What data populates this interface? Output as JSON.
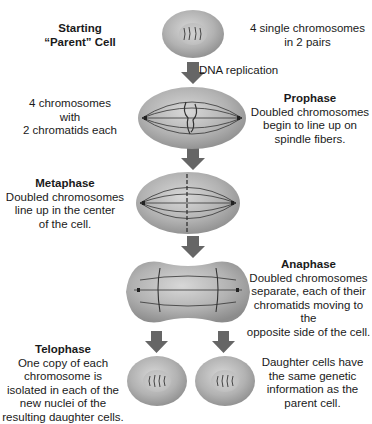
{
  "diagram": {
    "type": "mitosis-stages",
    "colors": {
      "cell_fill": "#b5b5b5",
      "cell_edge": "#8a8a8a",
      "nucleus": "#c9c9c9",
      "arrow": "#666666",
      "line": "#333333"
    },
    "stages": [
      {
        "id": "parent",
        "title": "Starting",
        "title2": "“Parent” Cell",
        "note_lines": [
          "4 single chromosomes",
          "in 2 pairs"
        ]
      },
      {
        "id": "replication",
        "arrow_label": "DNA replication"
      },
      {
        "id": "prophase",
        "left_lines": [
          "4 chromosomes",
          "with",
          "2 chromatids each"
        ],
        "title": "Prophase",
        "desc_lines": [
          "Doubled chromosomes",
          "begin to line up on",
          "spindle fibers."
        ]
      },
      {
        "id": "metaphase",
        "title": "Metaphase",
        "desc_lines": [
          "Doubled chromosomes",
          "line up in the center",
          "of the cell."
        ]
      },
      {
        "id": "anaphase",
        "title": "Anaphase",
        "desc_lines": [
          "Doubled chromosomes",
          "separate, each of their",
          "chromatids moving to the",
          "opposite side of the cell."
        ]
      },
      {
        "id": "telophase",
        "title": "Telophase",
        "desc_lines": [
          "One copy of each",
          "chromosome is",
          "isolated in each of the",
          "new nuclei of the",
          "resulting daughter cells."
        ],
        "note_lines": [
          "Daughter cells have",
          "the same genetic",
          "information as the",
          "parent cell."
        ]
      }
    ]
  }
}
